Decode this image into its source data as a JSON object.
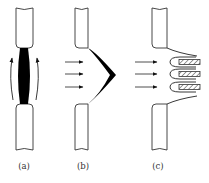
{
  "figure": {
    "panels": [
      {
        "id": "a",
        "label": "(a)",
        "description": "Two rods with black spindle-shaped neck between them; curved upward arrows on both sides"
      },
      {
        "id": "b",
        "label": "(b)",
        "description": "Two rods with black crescent film bulging right; three horizontal arrows from left"
      },
      {
        "id": "c",
        "label": "(c)",
        "description": "Two rods with three U-shaped loops wrapped around hatched rectangles; three horizontal arrows from left"
      }
    ],
    "colors": {
      "stroke": "#222222",
      "fill": "#000000",
      "background": "#ffffff"
    }
  }
}
